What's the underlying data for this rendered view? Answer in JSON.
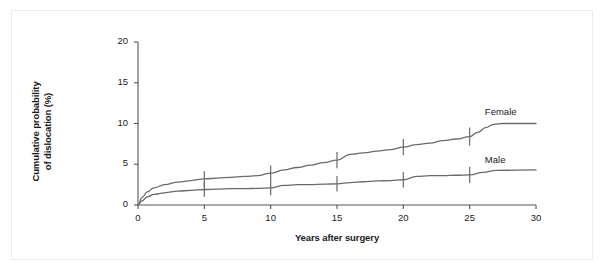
{
  "figure": {
    "background": "#ffffff",
    "border_color": "#ededed"
  },
  "chart_data": {
    "type": "line",
    "title": "",
    "xlabel": "Years after surgery",
    "ylabel": "Cumulative probability of dislocation (%)",
    "ylabel_line1": "Cumulative probability",
    "ylabel_line2": "of dislocation (%)",
    "xlim": [
      0,
      30
    ],
    "ylim": [
      0,
      20
    ],
    "xticks": [
      0,
      5,
      10,
      15,
      20,
      25,
      30
    ],
    "xtick_labels": [
      "0",
      "5",
      "10",
      "15",
      "20",
      "25",
      "30"
    ],
    "yticks": [
      0,
      5,
      10,
      15,
      20
    ],
    "ytick_labels": [
      "0",
      "5",
      "10",
      "15",
      "20"
    ],
    "grid": false,
    "legend_position": "inline-right",
    "line_color": "#6a6a6a",
    "axis_color": "#555555",
    "series": [
      {
        "name": "Female",
        "label": "Female",
        "label_x": 27.2,
        "label_y": 11.3,
        "final_value": 10.0,
        "x": [
          0,
          0.3,
          0.7,
          1.2,
          2.0,
          3.0,
          4.0,
          5.0,
          6.0,
          7.0,
          8.0,
          9.0,
          10.0,
          11.0,
          12.0,
          13.0,
          14.0,
          15.0,
          16.0,
          17.0,
          18.0,
          19.0,
          20.0,
          21.0,
          22.0,
          23.0,
          24.0,
          25.0,
          25.6,
          26.2,
          26.8,
          27.5,
          30.0
        ],
        "y": [
          0.0,
          0.9,
          1.6,
          2.1,
          2.5,
          2.8,
          3.0,
          3.2,
          3.3,
          3.4,
          3.5,
          3.6,
          3.9,
          4.3,
          4.6,
          4.9,
          5.2,
          5.5,
          6.2,
          6.4,
          6.6,
          6.8,
          7.1,
          7.4,
          7.6,
          7.9,
          8.1,
          8.4,
          8.9,
          9.5,
          9.9,
          10.0,
          10.0
        ],
        "ci_ticks": [
          {
            "x": 5.0,
            "y": 3.2,
            "half_height": 0.95
          },
          {
            "x": 10.0,
            "y": 3.9,
            "half_height": 0.95
          },
          {
            "x": 15.0,
            "y": 5.5,
            "half_height": 1.0
          },
          {
            "x": 20.0,
            "y": 7.1,
            "half_height": 1.0
          },
          {
            "x": 25.0,
            "y": 8.4,
            "half_height": 1.1
          }
        ]
      },
      {
        "name": "Male",
        "label": "Male",
        "label_x": 27.2,
        "label_y": 5.4,
        "final_value": 4.3,
        "x": [
          0,
          0.3,
          0.7,
          1.2,
          2.0,
          3.0,
          4.0,
          5.0,
          6.0,
          7.0,
          8.0,
          9.0,
          10.0,
          11.0,
          12.0,
          13.0,
          14.0,
          15.0,
          16.0,
          17.0,
          18.0,
          19.0,
          20.0,
          21.0,
          22.0,
          23.0,
          24.0,
          25.0,
          26.0,
          27.0,
          30.0
        ],
        "y": [
          0.0,
          0.5,
          1.0,
          1.3,
          1.5,
          1.7,
          1.8,
          1.9,
          1.95,
          2.0,
          2.0,
          2.05,
          2.1,
          2.4,
          2.5,
          2.5,
          2.55,
          2.6,
          2.75,
          2.85,
          2.95,
          3.0,
          3.1,
          3.5,
          3.6,
          3.6,
          3.65,
          3.7,
          4.0,
          4.25,
          4.3
        ],
        "ci_ticks": [
          {
            "x": 5.0,
            "y": 1.9,
            "half_height": 0.9
          },
          {
            "x": 10.0,
            "y": 2.1,
            "half_height": 0.9
          },
          {
            "x": 15.0,
            "y": 2.6,
            "half_height": 0.95
          },
          {
            "x": 20.0,
            "y": 3.1,
            "half_height": 0.95
          },
          {
            "x": 25.0,
            "y": 3.7,
            "half_height": 1.0
          }
        ]
      }
    ]
  }
}
